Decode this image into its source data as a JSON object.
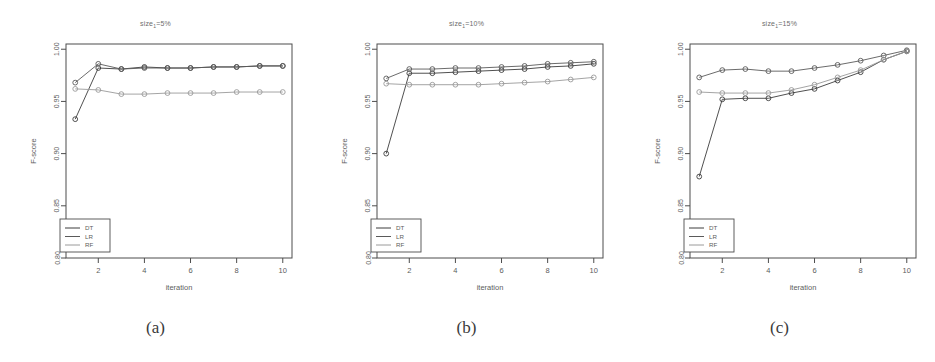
{
  "figure": {
    "panels": [
      {
        "id": "a",
        "caption": "(a)",
        "title_prefix": "size",
        "title_sub": "1",
        "title_suffix": "=5%"
      },
      {
        "id": "b",
        "caption": "(b)",
        "title_prefix": "size",
        "title_sub": "1",
        "title_suffix": "=10%"
      },
      {
        "id": "c",
        "caption": "(c)",
        "title_prefix": "size",
        "title_sub": "1",
        "title_suffix": "=15%"
      }
    ]
  },
  "chart_data": [
    {
      "type": "line",
      "panel": "a",
      "title": "size1=5%",
      "xlabel": "iteration",
      "ylabel": "F-score",
      "x": [
        1,
        2,
        3,
        4,
        5,
        6,
        7,
        8,
        9,
        10
      ],
      "xlim": [
        0.6,
        10.4
      ],
      "xticks": [
        2,
        4,
        6,
        8,
        10
      ],
      "xticklabels": [
        "2",
        "4",
        "6",
        "8",
        "10"
      ],
      "ylim": [
        0.8,
        1.005
      ],
      "yticks": [
        0.8,
        0.85,
        0.9,
        0.95,
        1.0
      ],
      "yticklabels": [
        "0.80",
        "0.85",
        "0.90",
        "0.95",
        "1.00"
      ],
      "grid": false,
      "legend_position": "bottom-left",
      "series": [
        {
          "name": "DT",
          "color": "#3c3c3c",
          "values": [
            0.933,
            0.982,
            0.981,
            0.983,
            0.982,
            0.982,
            0.983,
            0.983,
            0.984,
            0.984
          ]
        },
        {
          "name": "LR",
          "color": "#5a5a5a",
          "values": [
            0.968,
            0.986,
            0.981,
            0.982,
            0.982,
            0.982,
            0.983,
            0.983,
            0.984,
            0.984
          ]
        },
        {
          "name": "RF",
          "color": "#9a9a9a",
          "values": [
            0.962,
            0.961,
            0.957,
            0.957,
            0.958,
            0.958,
            0.958,
            0.959,
            0.959,
            0.959
          ]
        }
      ]
    },
    {
      "type": "line",
      "panel": "b",
      "title": "size1=10%",
      "xlabel": "iteration",
      "ylabel": "F-score",
      "x": [
        1,
        2,
        3,
        4,
        5,
        6,
        7,
        8,
        9,
        10
      ],
      "xlim": [
        0.6,
        10.4
      ],
      "xticks": [
        2,
        4,
        6,
        8,
        10
      ],
      "xticklabels": [
        "2",
        "4",
        "6",
        "8",
        "10"
      ],
      "ylim": [
        0.8,
        1.005
      ],
      "yticks": [
        0.8,
        0.85,
        0.9,
        0.95,
        1.0
      ],
      "yticklabels": [
        "0.80",
        "0.85",
        "0.90",
        "0.95",
        "1.00"
      ],
      "grid": false,
      "legend_position": "bottom-left",
      "series": [
        {
          "name": "DT",
          "color": "#3c3c3c",
          "values": [
            0.9,
            0.977,
            0.977,
            0.978,
            0.979,
            0.98,
            0.981,
            0.983,
            0.984,
            0.986
          ]
        },
        {
          "name": "LR",
          "color": "#5a5a5a",
          "values": [
            0.972,
            0.981,
            0.981,
            0.982,
            0.982,
            0.983,
            0.984,
            0.986,
            0.987,
            0.988
          ]
        },
        {
          "name": "RF",
          "color": "#9a9a9a",
          "values": [
            0.967,
            0.966,
            0.966,
            0.966,
            0.966,
            0.967,
            0.968,
            0.969,
            0.971,
            0.973
          ]
        }
      ]
    },
    {
      "type": "line",
      "panel": "c",
      "title": "size1=15%",
      "xlabel": "iteration",
      "ylabel": "F-score",
      "x": [
        1,
        2,
        3,
        4,
        5,
        6,
        7,
        8,
        9,
        10
      ],
      "xlim": [
        0.6,
        10.4
      ],
      "xticks": [
        2,
        4,
        6,
        8,
        10
      ],
      "xticklabels": [
        "2",
        "4",
        "6",
        "8",
        "10"
      ],
      "ylim": [
        0.8,
        1.005
      ],
      "yticks": [
        0.8,
        0.85,
        0.9,
        0.95,
        1.0
      ],
      "yticklabels": [
        "0.80",
        "0.85",
        "0.90",
        "0.95",
        "1.00"
      ],
      "grid": false,
      "legend_position": "bottom-left",
      "series": [
        {
          "name": "DT",
          "color": "#3c3c3c",
          "values": [
            0.878,
            0.952,
            0.953,
            0.953,
            0.958,
            0.962,
            0.97,
            0.978,
            0.99,
            0.998
          ]
        },
        {
          "name": "LR",
          "color": "#5a5a5a",
          "values": [
            0.973,
            0.98,
            0.981,
            0.979,
            0.979,
            0.982,
            0.985,
            0.989,
            0.994,
            0.999
          ]
        },
        {
          "name": "RF",
          "color": "#9a9a9a",
          "values": [
            0.959,
            0.958,
            0.958,
            0.958,
            0.961,
            0.966,
            0.973,
            0.98,
            0.99,
            0.998
          ]
        }
      ]
    }
  ]
}
